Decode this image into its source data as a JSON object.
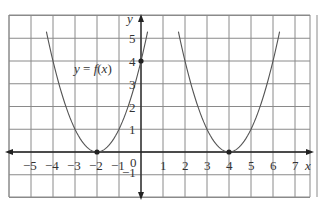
{
  "chart_data": {
    "type": "line",
    "title": "",
    "xlabel": "x",
    "ylabel": "y",
    "xlim": [
      -6,
      7.5
    ],
    "ylim": [
      -1.5,
      5.8
    ],
    "grid": true,
    "x_ticks": [
      -5,
      -4,
      -3,
      -2,
      -1,
      0,
      1,
      2,
      3,
      4,
      5,
      6,
      7
    ],
    "y_ticks": [
      -1,
      1,
      2,
      3,
      4,
      5
    ],
    "x_tick_labels": [
      "−5",
      "−4",
      "−3",
      "−2",
      "−1",
      "0",
      "1",
      "2",
      "3",
      "4",
      "5",
      "6",
      "7"
    ],
    "y_tick_labels": [
      "−1",
      "1",
      "2",
      "3",
      "4",
      "5"
    ],
    "series": [
      {
        "name": "y = f(x)",
        "equation": "y = (x + 2)^2",
        "vertex": [
          -2,
          0
        ],
        "x_range": [
          -4.3,
          0.3
        ],
        "marked_points": [
          [
            -2,
            0
          ],
          [
            0,
            4
          ]
        ]
      },
      {
        "name": "transformed",
        "equation": "y = (x - 4)^2",
        "vertex": [
          4,
          0
        ],
        "x_range": [
          1.7,
          6.3
        ],
        "marked_points": [
          [
            4,
            0
          ]
        ]
      }
    ],
    "annotations": [
      {
        "text": "y = f(x)",
        "x": -2.4,
        "y": 3.5
      }
    ]
  },
  "labels": {
    "x_axis": "x",
    "y_axis": "y",
    "function": "y = f(x)",
    "origin": "0"
  }
}
